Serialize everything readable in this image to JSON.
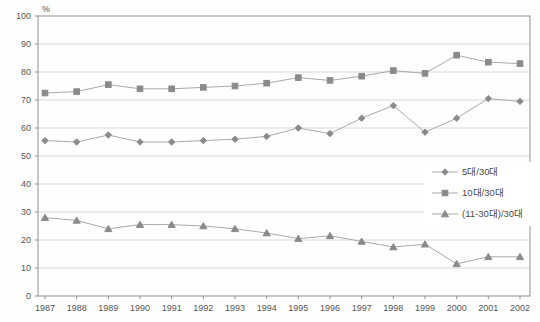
{
  "chart_data": {
    "type": "line",
    "title": "",
    "unit_label": "%",
    "x": [
      "1987",
      "1988",
      "1989",
      "1990",
      "1991",
      "1992",
      "1993",
      "1994",
      "1995",
      "1996",
      "1997",
      "1998",
      "1999",
      "2000",
      "2001",
      "2002"
    ],
    "ylim": [
      0,
      100
    ],
    "ytick_step": 10,
    "grid": "horizontal",
    "legend_position": "right-middle",
    "series": [
      {
        "name": "5대/30대",
        "marker": "diamond",
        "values": [
          55.5,
          55,
          57.5,
          55,
          55,
          55.5,
          56,
          57,
          60,
          58,
          63.5,
          68,
          58.5,
          63.5,
          70.5,
          69.5
        ]
      },
      {
        "name": "10대/30대",
        "marker": "square",
        "values": [
          72.5,
          73,
          75.5,
          74,
          74,
          74.5,
          75,
          76,
          78,
          77,
          78.5,
          80.5,
          79.5,
          86,
          83.5,
          83
        ]
      },
      {
        "name": "(11-30대)/30대",
        "marker": "triangle",
        "values": [
          28,
          27,
          24,
          25.5,
          25.5,
          25,
          24,
          22.5,
          20.5,
          21.5,
          19.5,
          17.5,
          18.5,
          11.5,
          14,
          14
        ]
      }
    ],
    "colors": {
      "background": "#fefefe",
      "plot_border": "#8f8f8f",
      "gridline": "#d8d8d8",
      "series_line": "#a9a9a9",
      "marker_fill": "#8a8a8a",
      "text": "#555555",
      "legend_background": "#ffffff"
    }
  }
}
